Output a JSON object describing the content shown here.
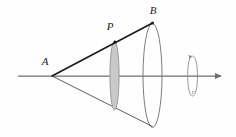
{
  "figure": {
    "type": "geometry-diagram",
    "canvas": {
      "width": 236,
      "height": 137,
      "background": "#fefefe"
    },
    "colors": {
      "axis": "#6e6e6e",
      "generator_line": "#1a1a1a",
      "lower_generator_line": "#4a4a4a",
      "ellipse_outline": "#6e6e6e",
      "disc_fill": "#c9c9c9",
      "disc_outline": "#8a8a8a",
      "label_text": "#1a1a1a",
      "rotation_arrow": "#8c8c8c"
    },
    "labels": [
      {
        "id": "A",
        "text": "A",
        "x": 45,
        "y": 62,
        "role": "cone-apex"
      },
      {
        "id": "P",
        "text": "P",
        "x": 110,
        "y": 27,
        "role": "point-on-generator"
      },
      {
        "id": "B",
        "text": "B",
        "x": 153,
        "y": 11,
        "role": "generator-endpoint"
      },
      {
        "id": "r",
        "text": "r",
        "x": 193,
        "y": 91,
        "role": "rotation-direction"
      }
    ],
    "points": [
      {
        "id": "A",
        "x": 52,
        "y": 76,
        "marked": false
      },
      {
        "id": "P",
        "x": 115,
        "y": 42,
        "marked": true
      },
      {
        "id": "B",
        "x": 152.5,
        "y": 23,
        "marked": true
      }
    ],
    "axis": {
      "x1": 18,
      "y1": 76,
      "x2": 226,
      "y2": 76,
      "has_arrowhead": true,
      "arrow_end": "right"
    },
    "generators": [
      {
        "id": "upper",
        "from": "A",
        "to": "B",
        "x1": 52,
        "y1": 76,
        "x2": 152.5,
        "y2": 23,
        "weight": "heavy"
      },
      {
        "id": "lower",
        "from": "A",
        "to": "B-reflected",
        "x1": 52,
        "y1": 76,
        "x2": 152.5,
        "y2": 126,
        "weight": "light"
      }
    ],
    "ellipses": [
      {
        "id": "base-circle",
        "cx": 152.5,
        "cy": 75.5,
        "rx": 9.5,
        "ry": 52,
        "fill": "none",
        "outline": "#6e6e6e"
      },
      {
        "id": "cross-section-disc",
        "cx": 114.5,
        "cy": 75.5,
        "rx": 4.5,
        "ry": 34.5,
        "fill": "#c9c9c9",
        "outline": "#8a8a8a"
      }
    ],
    "rotation_indicator": {
      "id": "rotation-loop",
      "cx": 192.5,
      "cy": 76,
      "rx": 6.5,
      "ry": 20,
      "arrow_at": "bottom",
      "label": "r"
    }
  }
}
